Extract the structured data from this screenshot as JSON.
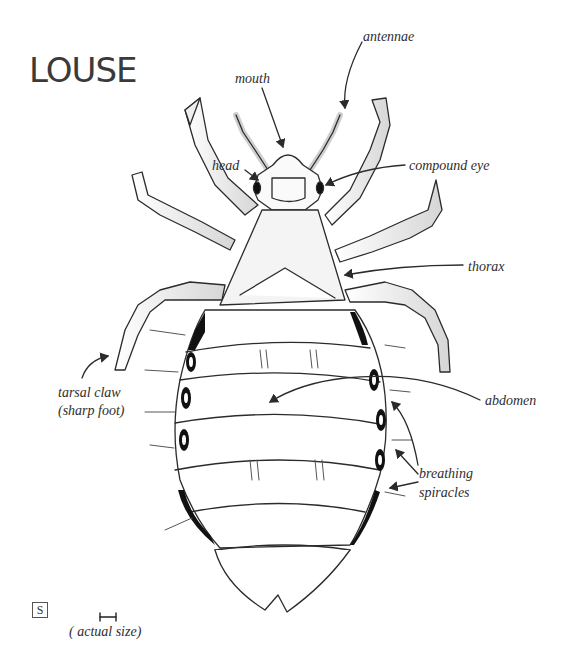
{
  "title": "LOUSE",
  "labels": {
    "antennae": "antennae",
    "mouth": "mouth",
    "head": "head",
    "compound_eye": "compound eye",
    "thorax": "thorax",
    "abdomen": "abdomen",
    "tarsal_claw_line1": "tarsal claw",
    "tarsal_claw_line2": "(sharp foot)",
    "breathing_line1": "breathing",
    "breathing_line2": "spiracles",
    "actual_size": "( actual size)"
  },
  "corner_mark": "S",
  "colors": {
    "ink": "#2b2b2b",
    "shade": "#d8d8d8",
    "spiracle": "#111111"
  }
}
